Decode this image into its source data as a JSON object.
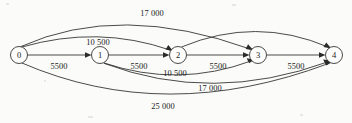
{
  "figure": {
    "type": "directed-graph",
    "caption": "",
    "background_color": "#fbfbf9",
    "ink_color": "#2a2a2a",
    "width": 352,
    "height": 123
  },
  "nodes": [
    {
      "id": "n0",
      "label": "0",
      "x": 19,
      "y": 55,
      "r": 8.5
    },
    {
      "id": "n1",
      "label": "1",
      "x": 100,
      "y": 55,
      "r": 8.5
    },
    {
      "id": "n2",
      "label": "2",
      "x": 178,
      "y": 55,
      "r": 8.5
    },
    {
      "id": "n3",
      "label": "3",
      "x": 258,
      "y": 55,
      "r": 8.5
    },
    {
      "id": "n4",
      "label": "4",
      "x": 334,
      "y": 55,
      "r": 8.5
    }
  ],
  "edges": [
    {
      "id": "e01",
      "from": "0",
      "to": "1",
      "label": "5500",
      "shape": "straight",
      "label_x": 59,
      "label_y": 66
    },
    {
      "id": "e12",
      "from": "1",
      "to": "2",
      "label": "5500",
      "shape": "straight",
      "label_x": 139,
      "label_y": 66
    },
    {
      "id": "e23",
      "from": "2",
      "to": "3",
      "label": "5500",
      "shape": "straight",
      "label_x": 218,
      "label_y": 66
    },
    {
      "id": "e34",
      "from": "3",
      "to": "4",
      "label": "5500",
      "shape": "straight",
      "label_x": 296,
      "label_y": 66
    },
    {
      "id": "e02",
      "from": "0",
      "to": "2",
      "label": "10 500",
      "shape": "arc-above",
      "label_x": 98,
      "label_y": 42
    },
    {
      "id": "e03",
      "from": "0",
      "to": "3",
      "label": "17 000",
      "shape": "arc-above",
      "label_x": 152,
      "label_y": 13
    },
    {
      "id": "e24",
      "from": "2",
      "to": "4",
      "label": "",
      "shape": "arc-above",
      "label_x": 0,
      "label_y": 0
    },
    {
      "id": "e13",
      "from": "1",
      "to": "3",
      "label": "10 500",
      "shape": "arc-below",
      "label_x": 175,
      "label_y": 73
    },
    {
      "id": "e14",
      "from": "1",
      "to": "4",
      "label": "17 000",
      "shape": "arc-below",
      "label_x": 210,
      "label_y": 88
    },
    {
      "id": "e04",
      "from": "0",
      "to": "4",
      "label": "25 000",
      "shape": "arc-below",
      "label_x": 163,
      "label_y": 106
    }
  ],
  "labels": {
    "cost_17000_top": "17 000",
    "cost_10500_top": "10 500",
    "cost_5500_a": "5500",
    "cost_5500_b": "5500",
    "cost_5500_c": "5500",
    "cost_5500_d": "5500",
    "cost_10500_mid": "10 500",
    "cost_17000_low": "17 000",
    "cost_25000_bottom": "25 000",
    "node_0": "0",
    "node_1": "1",
    "node_2": "2",
    "node_3": "3",
    "node_4": "4"
  }
}
